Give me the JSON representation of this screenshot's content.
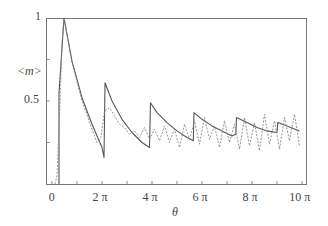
{
  "chart_data": {
    "type": "line",
    "title": "",
    "xlabel": "θ",
    "ylabel": "<m>",
    "xlim": [
      0,
      10.2
    ],
    "x_units": "π",
    "ylim": [
      0,
      1
    ],
    "grid": false,
    "legend": null,
    "x_ticks": [
      {
        "value": 0,
        "label": "0"
      },
      {
        "value": 2,
        "label": "2 π"
      },
      {
        "value": 4,
        "label": "4 π"
      },
      {
        "value": 6,
        "label": "6 π"
      },
      {
        "value": 8,
        "label": "8 π"
      },
      {
        "value": 10,
        "label": "10 π"
      }
    ],
    "y_ticks": [
      {
        "value": 0.5,
        "label": "0.5"
      },
      {
        "value": 1,
        "label": "1"
      }
    ],
    "series": [
      {
        "name": "solid",
        "style": "solid",
        "color": "#555555",
        "x_over_pi": [
          0.28,
          0.28,
          0.48,
          0.8,
          1.2,
          1.6,
          2.0,
          2.08,
          2.12,
          2.4,
          2.8,
          3.2,
          3.6,
          3.9,
          3.94,
          4.2,
          4.6,
          5.0,
          5.4,
          5.65,
          5.68,
          6.0,
          6.4,
          6.8,
          7.2,
          7.35,
          7.38,
          7.8,
          8.2,
          8.6,
          9.0,
          9.03,
          9.4,
          9.9
        ],
        "values": [
          0.0,
          0.55,
          1.0,
          0.74,
          0.52,
          0.36,
          0.22,
          0.16,
          0.61,
          0.5,
          0.39,
          0.31,
          0.25,
          0.22,
          0.49,
          0.43,
          0.37,
          0.32,
          0.28,
          0.26,
          0.43,
          0.39,
          0.35,
          0.32,
          0.29,
          0.3,
          0.4,
          0.37,
          0.34,
          0.32,
          0.31,
          0.37,
          0.35,
          0.32
        ]
      },
      {
        "name": "dashed",
        "style": "dashed",
        "color": "#888888",
        "x_over_pi": [
          0.12,
          0.2,
          0.3,
          0.4,
          0.48,
          0.8,
          1.2,
          1.6,
          1.8,
          1.95,
          2.1,
          2.3,
          2.5,
          2.7,
          2.9,
          3.1,
          3.3,
          3.5,
          3.7,
          3.9,
          4.1,
          4.3,
          4.5,
          4.7,
          4.9,
          5.1,
          5.3,
          5.5,
          5.7,
          5.9,
          6.1,
          6.3,
          6.5,
          6.7,
          6.9,
          7.1,
          7.3,
          7.5,
          7.7,
          7.9,
          8.1,
          8.3,
          8.5,
          8.7,
          8.9,
          9.1,
          9.3,
          9.5,
          9.7,
          9.9
        ],
        "values": [
          0.0,
          0.05,
          0.4,
          0.85,
          1.0,
          0.73,
          0.5,
          0.33,
          0.25,
          0.28,
          0.44,
          0.46,
          0.41,
          0.36,
          0.34,
          0.3,
          0.32,
          0.28,
          0.34,
          0.27,
          0.33,
          0.26,
          0.35,
          0.25,
          0.33,
          0.22,
          0.36,
          0.27,
          0.38,
          0.24,
          0.4,
          0.27,
          0.35,
          0.22,
          0.38,
          0.25,
          0.36,
          0.21,
          0.4,
          0.23,
          0.37,
          0.2,
          0.42,
          0.24,
          0.38,
          0.21,
          0.4,
          0.26,
          0.42,
          0.23
        ]
      }
    ]
  }
}
